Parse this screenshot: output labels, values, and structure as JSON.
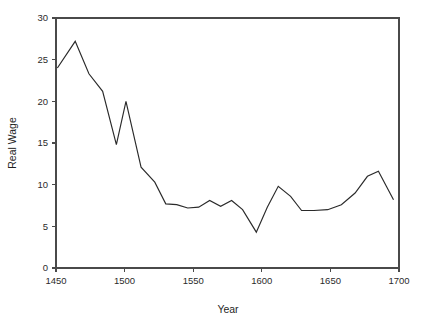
{
  "chart_data": {
    "type": "line",
    "title": "",
    "xlabel": "Year",
    "ylabel": "Real Wage",
    "xlim": [
      1450,
      1700
    ],
    "ylim": [
      0,
      30
    ],
    "grid": false,
    "legend": false,
    "legend_position": "none",
    "xticks": [
      1450,
      1500,
      1550,
      1600,
      1650,
      1700
    ],
    "xtick_labels": [
      "1450",
      "1500",
      "1550",
      "1600",
      "1650",
      "1700"
    ],
    "yticks": [
      0,
      5,
      10,
      15,
      20,
      25,
      30
    ],
    "ytick_labels": [
      "0",
      "5",
      "10",
      "15",
      "20",
      "25",
      "30"
    ],
    "line_color": "#2a2a2a",
    "axis_color": "#4a4a4a",
    "series": [
      {
        "name": "Real Wage",
        "x": [
          1451,
          1464,
          1474,
          1484,
          1494,
          1501,
          1512,
          1522,
          1530,
          1538,
          1546,
          1554,
          1562,
          1570,
          1578,
          1586,
          1596,
          1604,
          1612,
          1621,
          1629,
          1638,
          1648,
          1658,
          1668,
          1677,
          1685,
          1696
        ],
        "values": [
          24.0,
          27.2,
          23.3,
          21.2,
          14.8,
          20.0,
          12.1,
          10.3,
          7.7,
          7.6,
          7.2,
          7.3,
          8.1,
          7.4,
          8.1,
          7.0,
          4.3,
          7.3,
          9.8,
          8.6,
          6.9,
          6.9,
          7.0,
          7.6,
          9.0,
          11.0,
          11.6,
          8.2
        ]
      }
    ]
  },
  "plot_geometry": {
    "left": 56,
    "right": 399,
    "top": 18,
    "bottom": 268
  }
}
